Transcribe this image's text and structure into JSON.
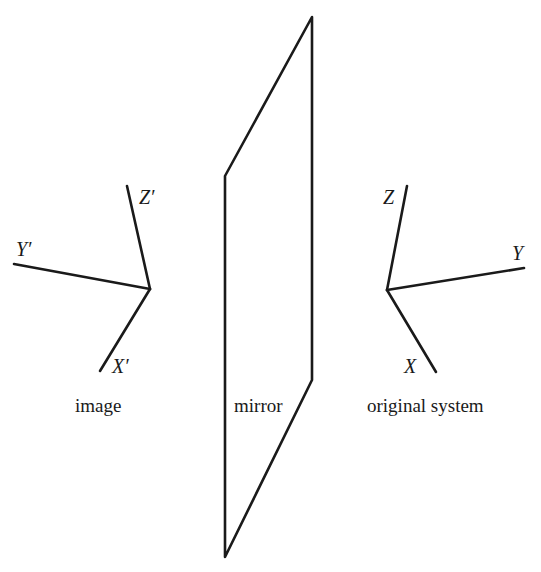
{
  "diagram": {
    "type": "mirror reflection of coordinate system",
    "image_system": {
      "caption": "image",
      "axes": {
        "x": "X′",
        "y": "Y′",
        "z": "Z′"
      }
    },
    "mirror": {
      "caption": "mirror"
    },
    "original_system": {
      "caption": "original system",
      "axes": {
        "x": "X",
        "y": "Y",
        "z": "Z"
      }
    },
    "colors": {
      "line": "#1a1a1a",
      "background": "#ffffff"
    }
  }
}
